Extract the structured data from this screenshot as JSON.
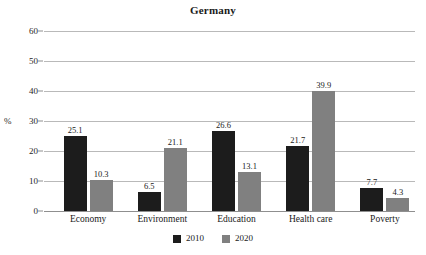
{
  "chart_data": {
    "type": "bar",
    "title": "Germany",
    "xlabel": "",
    "ylabel": "%",
    "ylim": [
      0,
      60
    ],
    "yticks": [
      0,
      10,
      20,
      30,
      40,
      50,
      60
    ],
    "grid": true,
    "legend_position": "bottom-center",
    "categories": [
      "Economy",
      "Environment",
      "Education",
      "Health care",
      "Poverty"
    ],
    "series": [
      {
        "name": "2010",
        "color": "#1c1c1c",
        "values": [
          25.1,
          6.5,
          26.6,
          21.7,
          7.7
        ],
        "labels": [
          "25.1",
          "6.5",
          "26.6",
          "21.7",
          "7.7"
        ]
      },
      {
        "name": "2020",
        "color": "#808080",
        "values": [
          10.3,
          21.1,
          13.1,
          39.9,
          4.3
        ],
        "labels": [
          "10.3",
          "21.1",
          "13.1",
          "39.9",
          "4.3"
        ]
      }
    ]
  },
  "axis": {
    "unit_label": "%",
    "tick_labels": [
      "60",
      "50",
      "40",
      "30",
      "20",
      "10",
      "0"
    ]
  },
  "legend": {
    "items": [
      {
        "label": "2010",
        "color": "#1c1c1c"
      },
      {
        "label": "2020",
        "color": "#808080"
      }
    ]
  },
  "colors": {
    "background": "#ffffff",
    "series_2010": "#1c1c1c",
    "series_2020": "#808080",
    "gridline": "#b9b9b9",
    "axis": "#8f8f8f",
    "text": "#1a1a1a"
  }
}
